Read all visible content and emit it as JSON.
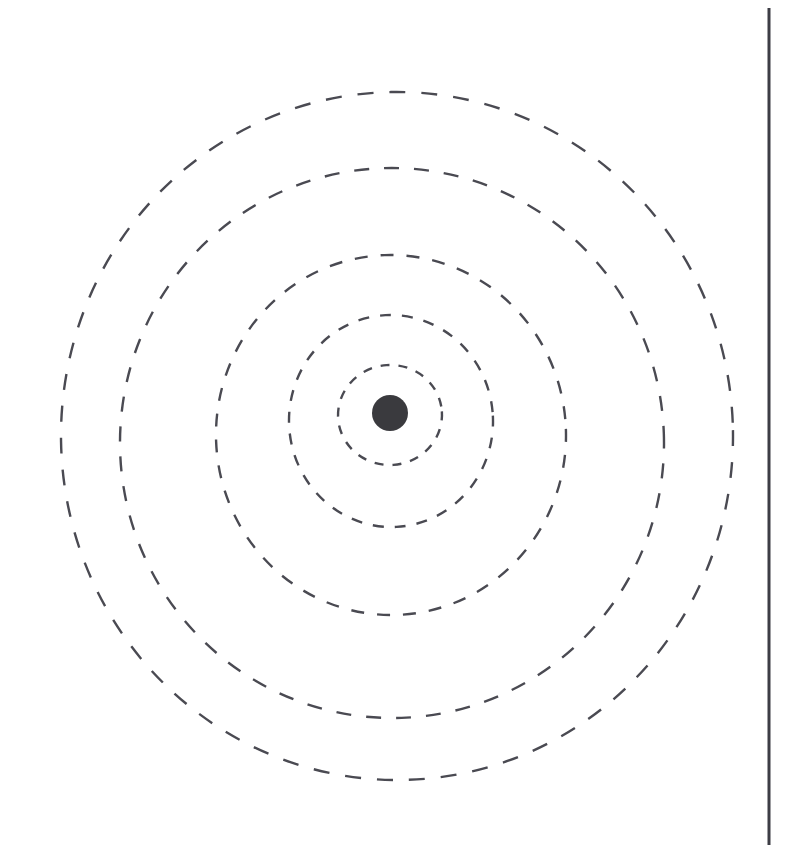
{
  "canvas": {
    "width": 801,
    "height": 845,
    "background_color": "#ffffff"
  },
  "diagram": {
    "type": "concentric-rings",
    "stroke_color": "#4a4a52",
    "center_dot": {
      "name": "center-node",
      "cx": 390,
      "cy": 413,
      "r": 18,
      "fill_color": "#3a3a3e"
    },
    "rings": [
      {
        "index": 1,
        "label": "ring-1-innermost",
        "cx": 390,
        "cy": 415,
        "rx": 52,
        "ry": 50,
        "stroke_width": 2.4,
        "dash": "9 9",
        "rotate": -4
      },
      {
        "index": 2,
        "label": "ring-2",
        "cx": 391,
        "cy": 421,
        "rx": 102,
        "ry": 106,
        "stroke_width": 2.4,
        "dash": "11 11",
        "rotate": -3
      },
      {
        "index": 3,
        "label": "ring-3",
        "cx": 391,
        "cy": 435,
        "rx": 175,
        "ry": 180,
        "stroke_width": 2.4,
        "dash": "13 13",
        "rotate": -2
      },
      {
        "index": 4,
        "label": "ring-4",
        "cx": 392,
        "cy": 443,
        "rx": 272,
        "ry": 275,
        "stroke_width": 2.4,
        "dash": "15 15",
        "rotate": -2
      },
      {
        "index": 5,
        "label": "ring-5-outermost",
        "cx": 397,
        "cy": 436,
        "rx": 336,
        "ry": 344,
        "stroke_width": 2.4,
        "dash": "16 16",
        "rotate": -1
      }
    ],
    "vertical_rule": {
      "name": "right-vertical-rule",
      "x": 769,
      "y1": 8,
      "y2": 845,
      "stroke_width": 3,
      "stroke_color": "#3d3d45"
    }
  }
}
